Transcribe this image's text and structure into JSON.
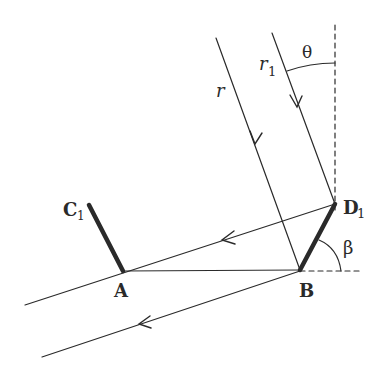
{
  "figure": {
    "width": 390,
    "height": 376,
    "background": "#ffffff",
    "line_color": "#2a2a2a"
  },
  "labels": {
    "theta": "θ",
    "r": "r",
    "r1_base": "r",
    "r1_sub": "1",
    "C1_base": "C",
    "C1_sub": "1",
    "D1_base": "D",
    "D1_sub": "1",
    "A": "A",
    "B": "B",
    "beta": "β"
  },
  "points": {
    "A": [
      123,
      271
    ],
    "B": [
      300,
      270
    ],
    "C1": [
      89,
      205
    ],
    "D1": [
      335,
      204
    ]
  },
  "rays": {
    "r": {
      "from": [
        216,
        38
      ],
      "to": [
        300,
        270
      ]
    },
    "r1": {
      "from": [
        272,
        33
      ],
      "to": [
        335,
        204
      ]
    }
  },
  "mirrors": [
    {
      "name": "AC1",
      "from": [
        123,
        271
      ],
      "to": [
        89,
        205
      ]
    },
    {
      "name": "BD1",
      "from": [
        300,
        270
      ],
      "to": [
        335,
        204
      ]
    }
  ]
}
